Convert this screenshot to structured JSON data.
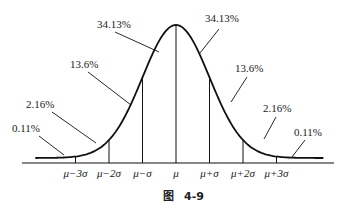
{
  "figure": {
    "caption_prefix": "图",
    "caption_number": "4-9"
  },
  "chart_data": {
    "type": "area",
    "title": "",
    "x_ticks": [
      "μ−3σ",
      "μ−2σ",
      "μ−σ",
      "μ",
      "μ+σ",
      "μ+2σ",
      "μ+3σ"
    ],
    "x_tick_sigmas": [
      -3,
      -2,
      -1,
      0,
      1,
      2,
      3
    ],
    "regions": [
      {
        "from": -4,
        "to": -3,
        "label": "0.11%",
        "value": 0.11
      },
      {
        "from": -3,
        "to": -2,
        "label": "2.16%",
        "value": 2.16
      },
      {
        "from": -2,
        "to": -1,
        "label": "13.6%",
        "value": 13.6
      },
      {
        "from": -1,
        "to": 0,
        "label": "34.13%",
        "value": 34.13
      },
      {
        "from": 0,
        "to": 1,
        "label": "34.13%",
        "value": 34.13
      },
      {
        "from": 1,
        "to": 2,
        "label": "13.6%",
        "value": 13.6
      },
      {
        "from": 2,
        "to": 3,
        "label": "2.16%",
        "value": 2.16
      },
      {
        "from": 3,
        "to": 4,
        "label": "0.11%",
        "value": 0.11
      }
    ],
    "xlabel": "",
    "ylabel": ""
  }
}
